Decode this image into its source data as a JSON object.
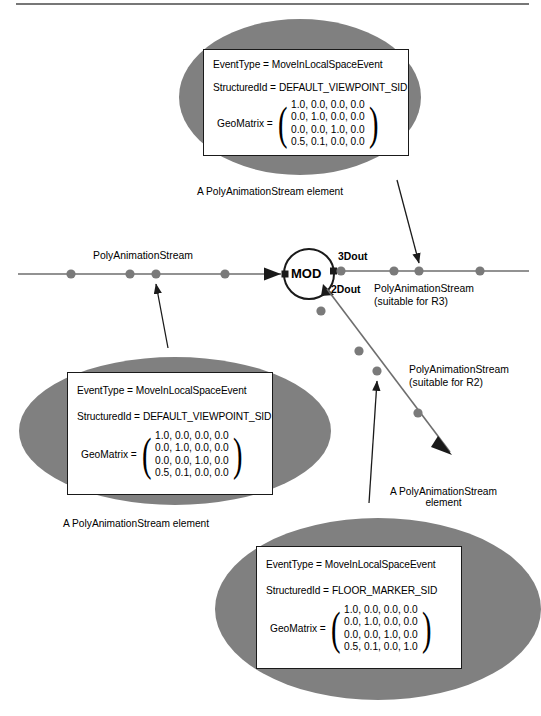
{
  "page": {
    "width": 541,
    "height": 716,
    "background": "#ffffff",
    "ellipse_fill": "#808080",
    "line_color": "#6e6e6e",
    "node_color": "#7a7a7a",
    "ink": "#1a1a1a",
    "has_top_rule": true
  },
  "callouts": [
    {
      "id": "top-callout",
      "event_type_label": "EventType =",
      "event_type_value": "MoveInLocalSpaceEvent",
      "structured_id_label": "StructuredId =",
      "structured_id_value": "DEFAULT_VIEWPOINT_SID",
      "matrix_label": "GeoMatrix =",
      "matrix_rows": [
        "1.0, 0.0, 0.0, 0.0",
        "0.0, 1.0, 0.0, 0.0",
        "0.0, 0.0, 1.0, 0.0",
        "0.5, 0.1, 0.0, 0.0"
      ],
      "caption": "A PolyAnimationStream element"
    },
    {
      "id": "left-callout",
      "event_type_label": "EventType =",
      "event_type_value": "MoveInLocalSpaceEvent",
      "structured_id_label": "StructuredId =",
      "structured_id_value": "DEFAULT_VIEWPOINT_SID",
      "matrix_label": "GeoMatrix =",
      "matrix_rows": [
        "1.0, 0.0, 0.0, 0.0",
        "0.0, 1.0, 0.0, 0.0",
        "0.0, 0.0, 1.0, 0.0",
        "0.5, 0.1, 0.0, 0.0"
      ],
      "caption": "A PolyAnimationStream element"
    },
    {
      "id": "bottom-callout",
      "event_type_label": "EventType =",
      "event_type_value": "MoveInLocalSpaceEvent",
      "structured_id_label": "StructuredId =",
      "structured_id_value": "FLOOR_MARKER_SID",
      "matrix_label": "GeoMatrix =",
      "matrix_rows": [
        "1.0, 0.0, 0.0, 0.0",
        "0.0, 1.0, 0.0, 0.0",
        "0.0, 0.0, 1.0, 0.0",
        "0.5, 0.1, 0.0, 1.0"
      ],
      "caption_line1": "A PolyAnimationStream",
      "caption_line2": "element"
    }
  ],
  "graph": {
    "node_label": "MOD",
    "port_3d": "3Dout",
    "port_2d": "2Dout",
    "input_stream_label": "PolyAnimationStream",
    "r3_stream_line1": "PolyAnimationStream",
    "r3_stream_line2": "(suitable for R3)",
    "r2_stream_line1": "PolyAnimationStream",
    "r2_stream_line2": "(suitable for R2)",
    "input_dots": 4,
    "r3_dots": 4,
    "r2_dots": 4
  }
}
